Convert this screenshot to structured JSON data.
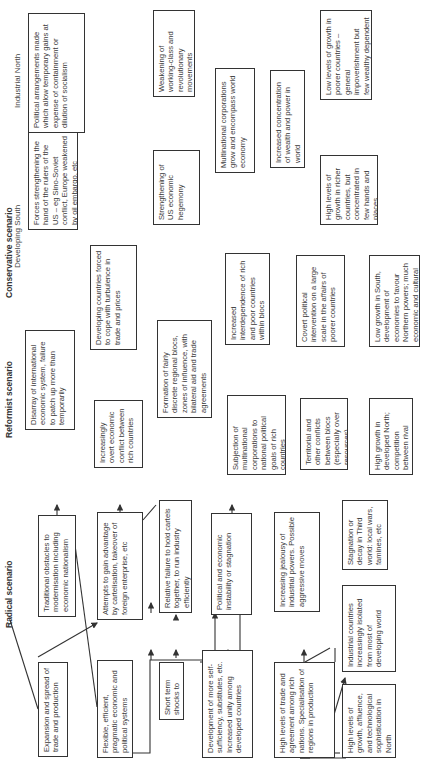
{
  "scenarios": {
    "conservative": {
      "title": "Conservative scenario",
      "columns": {
        "north": "Industrial North",
        "south": "Developing South"
      },
      "boxes": {
        "expansion": "Expansion and spread of trade and production",
        "traditional": "Traditional obstacles to modernisation including economic nationalism",
        "flexible": "Flexible, efficient, pragmatic economic and political systems",
        "attempts": "Attempts to gain advantage by cartelisation, takeover of foreign enterprise, etc",
        "short_term": "Short term shocks to economies",
        "relative_failure": "Relative failure to hold cartels together, to run industry efficiently",
        "development": "Development of more self-sufficiency, substitutes, etc. Increased unity among developed countries",
        "instability": "Political and economic instability or stagnation",
        "high_trade": "High levels of trade and agreement among rich nations. Specialisation of regions in production",
        "jealousy": "Increasing jealousy of industrial powers. Possible aggressive moves",
        "high_growth": "High levels of growth, affluence, and technological sophistication in North",
        "isolated": "Industrial countries increasingly isolated from most of developing world",
        "stagnation": "Stagnation or decay in Third world: local wars, famines, etc"
      }
    },
    "reformist": {
      "title": "Reformist scenario",
      "boxes": {
        "disarray": "Disarray of international economic system, failure to patch up more than temporarily",
        "overt_conflict": "Increasingly overt economic conflict between rich countries",
        "developing_forced": "Developing countries forced to cope with turbulence in trade and prices",
        "formation": "Formation of fairly discrete regional blocs, zones of influence, with bilateral aid and trade agreements",
        "subjection": "Subjection of multinational corporations to national political goals of rich countries",
        "interdependence": "Increased interdependence of rich and poor countries within blocs",
        "territorial": "Territorial and other conflicts between blocs (especially over resources), generally low key",
        "covert": "Covert political intervention on a large scale in the affairs of poorer countries",
        "high_growth_north": "High growth in developed North; competition between rival industrial powers",
        "low_growth_south": "Low growth in South, development of economies to favour Northern powers; much economic and cultural dependence"
      }
    },
    "radical": {
      "title": "Radical scenario",
      "boxes": {
        "forces": "Forces strengthening the hand of the rulers of the US – eg Sino-Soviet conflict, Europe weakened by oil embargo, etc",
        "political_arrangements": "Political arrangements made which allow temporary gains at expense of containment or dilution of socialism",
        "strengthening_us": "Strengthening of US economic hegemony",
        "weakening": "Weakening of working-class and revolutionary movements",
        "multinational": "Multinational corporations grow and encompass world economy",
        "concentration": "Increased concentration of wealth and power in world",
        "high_richer": "High levels of growth in richer countries, but concentrated in few hands and places",
        "low_poorer": "Low levels of growth in poorer countries – general impoverishment but few wealthy dependent elites"
      }
    }
  }
}
